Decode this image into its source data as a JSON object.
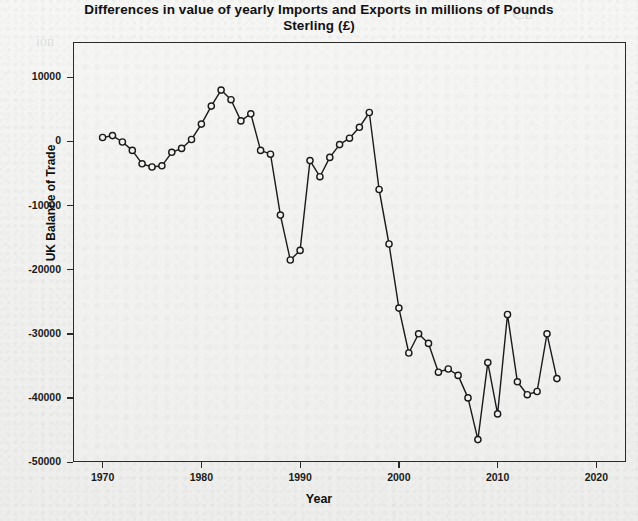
{
  "chart_data": {
    "type": "line",
    "title": "Differences in value of yearly Imports and Exports in millions of Pounds Sterling (£)",
    "title_line1": "Differences in value of yearly Imports and Exports in millions of Pounds",
    "title_line2": "Sterling (£)",
    "xlabel": "Year",
    "ylabel": "UK Balance of Trade",
    "xlim": [
      1967,
      2023
    ],
    "ylim": [
      -50000,
      15500
    ],
    "grid": false,
    "legend": "none",
    "marker": "open-circle",
    "line_color": "#1a1a1a",
    "marker_color": "#1a1a1a",
    "xticks": [
      1970,
      1980,
      1990,
      2000,
      2010,
      2020
    ],
    "xtick_labels": [
      "1970",
      "1980",
      "1990",
      "2000",
      "2010",
      "2020"
    ],
    "yticks": [
      10000,
      0,
      -10000,
      -20000,
      -30000,
      -40000,
      -50000
    ],
    "ytick_labels": [
      "10000",
      "0",
      "-10000",
      "-20000",
      "-30000",
      "-40000",
      "-50000"
    ],
    "x": [
      1970,
      1971,
      1972,
      1973,
      1974,
      1975,
      1976,
      1977,
      1978,
      1979,
      1980,
      1981,
      1982,
      1983,
      1984,
      1985,
      1986,
      1987,
      1988,
      1989,
      1990,
      1991,
      1992,
      1993,
      1994,
      1995,
      1996,
      1997,
      1998,
      1999,
      2000,
      2001,
      2002,
      2003,
      2004,
      2005,
      2006,
      2007,
      2008,
      2009,
      2010,
      2011,
      2012,
      2013,
      2014,
      2015,
      2016
    ],
    "values": [
      600,
      900,
      -100,
      -1400,
      -3500,
      -4000,
      -3800,
      -1700,
      -1100,
      300,
      2700,
      5500,
      8000,
      6500,
      3200,
      4300,
      -1400,
      -2000,
      -11500,
      -18500,
      -17000,
      -3000,
      -5500,
      -2500,
      -500,
      500,
      2200,
      4500,
      -7500,
      -16000,
      -26000,
      -33000,
      -30000,
      -31500,
      -36000,
      -35500,
      -36500,
      -40000,
      -46500,
      -34500,
      -42500,
      -27000,
      -37500,
      -39500,
      -39000,
      -30000,
      -37000
    ],
    "series_name": "UK Balance of Trade"
  },
  "ghost_text": {
    "items": [
      {
        "text": "Ca",
        "x": 512,
        "y": 2,
        "size": 19
      },
      {
        "text": "ion",
        "x": 36,
        "y": 34,
        "size": 14
      },
      {
        "text": "a and Cor",
        "x": 196,
        "y": 56,
        "size": 15
      },
      {
        "text": "ption Activitie",
        "x": 212,
        "y": 55,
        "size": 15
      },
      {
        "text": "nsumption",
        "x": 424,
        "y": 52,
        "size": 15
      },
      {
        "text": "g during recent Stat",
        "x": 150,
        "y": 88,
        "size": 15
      },
      {
        "text": "sumption",
        "x": 376,
        "y": 86,
        "size": 15
      },
      {
        "text": "nts",
        "x": 556,
        "y": 86,
        "size": 15
      },
      {
        "text": "the unit of con",
        "x": 152,
        "y": 114,
        "size": 15
      },
      {
        "text": "n to the ecor",
        "x": 330,
        "y": 112,
        "size": 15
      },
      {
        "text": "of thi",
        "x": 152,
        "y": 142,
        "size": 15
      },
      {
        "text": "e Statistical co",
        "x": 196,
        "y": 168,
        "size": 10
      },
      {
        "text": "s of consumption",
        "x": 316,
        "y": 168,
        "size": 10
      }
    ]
  }
}
